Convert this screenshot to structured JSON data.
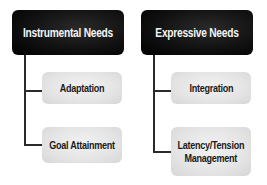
{
  "diagram": {
    "type": "hierarchy",
    "columns": [
      {
        "title": "Instrumental Needs",
        "children": [
          "Adaptation",
          "Goal Attainment"
        ]
      },
      {
        "title": "Expressive Needs",
        "children": [
          "Integration",
          "Latency/Tension Management"
        ]
      }
    ],
    "colors": {
      "header_bg": "#0a0a0a",
      "header_text": "#f4f4f4",
      "child_bg": "#e4e4e4",
      "child_text": "#1a1a1a",
      "connector": "#2a2a2a"
    }
  }
}
